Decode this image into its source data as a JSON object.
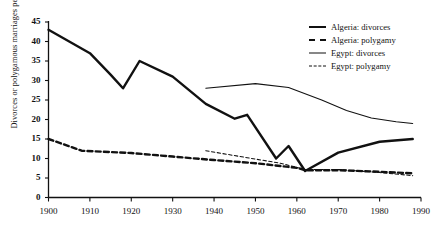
{
  "chart_data": {
    "type": "line",
    "title": "",
    "xlabel": "",
    "ylabel": "Divorces or polygamous marriages per 100 marriages",
    "xlim": [
      1900,
      1990
    ],
    "ylim": [
      0,
      45
    ],
    "xticks": [
      1900,
      1910,
      1920,
      1930,
      1940,
      1950,
      1960,
      1970,
      1980,
      1990
    ],
    "yticks": [
      0,
      5,
      10,
      15,
      20,
      25,
      30,
      35,
      40,
      45
    ],
    "grid": false,
    "legend_position": "top-right",
    "series": [
      {
        "name": "Algeria: divorces",
        "style": "thick-solid",
        "points": [
          [
            1900,
            43.0
          ],
          [
            1910,
            37.0
          ],
          [
            1915,
            31.5
          ],
          [
            1918,
            28.0
          ],
          [
            1922,
            35.0
          ],
          [
            1930,
            31.0
          ],
          [
            1938,
            24.0
          ],
          [
            1945,
            20.2
          ],
          [
            1948,
            21.2
          ],
          [
            1955,
            10.0
          ],
          [
            1958,
            13.2
          ],
          [
            1962,
            6.8
          ],
          [
            1970,
            11.5
          ],
          [
            1980,
            14.3
          ],
          [
            1988,
            15.0
          ]
        ]
      },
      {
        "name": "Algeria: polygamy",
        "style": "thick-dash",
        "points": [
          [
            1900,
            15.0
          ],
          [
            1908,
            12.0
          ],
          [
            1920,
            11.4
          ],
          [
            1930,
            10.5
          ],
          [
            1940,
            9.6
          ],
          [
            1950,
            8.8
          ],
          [
            1960,
            7.6
          ],
          [
            1962,
            7.0
          ],
          [
            1970,
            7.0
          ],
          [
            1980,
            6.6
          ],
          [
            1988,
            6.2
          ]
        ]
      },
      {
        "name": "Egypt: divorces",
        "style": "thin-solid",
        "points": [
          [
            1938,
            28.0
          ],
          [
            1950,
            29.2
          ],
          [
            1958,
            28.2
          ],
          [
            1966,
            25.0
          ],
          [
            1972,
            22.3
          ],
          [
            1978,
            20.4
          ],
          [
            1984,
            19.4
          ],
          [
            1988,
            19.0
          ]
        ]
      },
      {
        "name": "Egypt: polygamy",
        "style": "thin-dash",
        "points": [
          [
            1938,
            12.0
          ],
          [
            1948,
            10.2
          ],
          [
            1956,
            8.8
          ],
          [
            1962,
            7.2
          ],
          [
            1970,
            7.2
          ],
          [
            1980,
            6.4
          ],
          [
            1988,
            5.6
          ]
        ]
      }
    ]
  },
  "legend": {
    "items": [
      {
        "label": "Algeria: divorces",
        "style": "thick-solid"
      },
      {
        "label": "Algeria: polygamy",
        "style": "thick-dash"
      },
      {
        "label": "Egypt: divorces",
        "style": "thin-solid"
      },
      {
        "label": "Egypt: polygamy",
        "style": "thin-dash"
      }
    ]
  },
  "colors": {
    "ink": "#111111",
    "background": "#ffffff"
  }
}
